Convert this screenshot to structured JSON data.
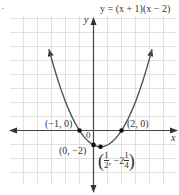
{
  "chart_data": {
    "type": "line",
    "title": "y = (x + 1)(x − 2)",
    "equation": "y = (x + 1)(x − 2)",
    "xlabel": "x",
    "ylabel": "y",
    "grid": true,
    "origin_label": "0",
    "xlim": [
      -6,
      6
    ],
    "ylim": [
      -6,
      12
    ],
    "points": [
      {
        "x": -1,
        "y": 0,
        "label": "(−1, 0)"
      },
      {
        "x": 2,
        "y": 0,
        "label": "(2, 0)"
      },
      {
        "x": 0,
        "y": -2,
        "label": "(0, −2)"
      },
      {
        "x": 0.5,
        "y": -2.25,
        "label": "(1/2, −2 1/4)"
      }
    ],
    "vertex_label": {
      "open": "(",
      "num": "1",
      "den": "2",
      "mid": ", −2",
      "whole_frac_num": "1",
      "whole_frac_den": "4",
      "close": ")"
    }
  },
  "labels": {
    "equation": "y = (x + 1)(x − 2)",
    "x_axis": "x",
    "y_axis": "y",
    "origin": "0",
    "pt_neg1": "(−1, 0)",
    "pt_2": "(2, 0)",
    "pt_0": "(0, −2)"
  }
}
